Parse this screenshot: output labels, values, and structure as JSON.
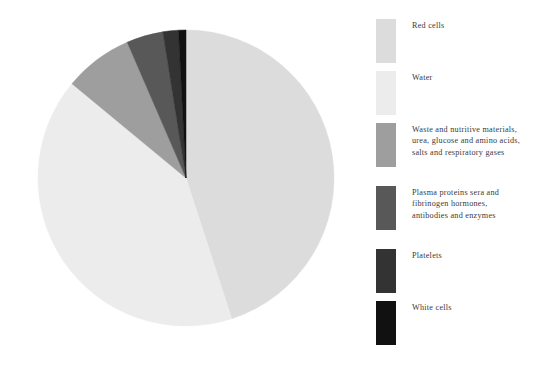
{
  "background_color": "#ffffff",
  "chart_data": {
    "type": "pie",
    "title": "",
    "subtitle": "",
    "xlabel": "",
    "ylabel": "",
    "legend_position": "right",
    "grid": false,
    "start_angle_deg": 0,
    "direction": "clockwise",
    "center": {
      "x": 186,
      "y": 178
    },
    "radius": 148,
    "categories": [
      "Red cells",
      "Water",
      "Waste and nutritive materials,\nurea, glucose and amino acids,\nsalts and respiratory gases",
      "Plasma proteins sera and\nfibrinogen hormones,\nantibodies and enzymes",
      "Platelets",
      "White cells"
    ],
    "values": [
      45.0,
      41.0,
      7.5,
      4.0,
      1.7,
      0.8
    ],
    "colors": [
      "#dcdcdc",
      "#ececec",
      "#9e9e9e",
      "#585858",
      "#333333",
      "#111111"
    ],
    "slices": [
      {
        "label": "Red cells",
        "value": 45.0,
        "color": "#dcdcdc",
        "start_deg": 0.0,
        "end_deg": 162.0
      },
      {
        "label": "Water",
        "value": 41.0,
        "color": "#ececec",
        "start_deg": 162.0,
        "end_deg": 309.6
      },
      {
        "label": "Waste and nutritive materials, urea, glucose and amino acids, salts and respiratory gases",
        "value": 7.5,
        "color": "#9e9e9e",
        "start_deg": 309.6,
        "end_deg": 336.6
      },
      {
        "label": "Plasma proteins sera and fibrinogen hormones, antibodies and enzymes",
        "value": 4.0,
        "color": "#585858",
        "start_deg": 336.6,
        "end_deg": 351.0
      },
      {
        "label": "Platelets",
        "value": 1.7,
        "color": "#333333",
        "start_deg": 351.0,
        "end_deg": 357.1
      },
      {
        "label": "White cells",
        "value": 0.8,
        "color": "#111111",
        "start_deg": 357.1,
        "end_deg": 360.0
      }
    ]
  },
  "legend": {
    "items": [
      {
        "label": "Red cells",
        "color": "#dcdcdc"
      },
      {
        "label": "Water",
        "color": "#ececec"
      },
      {
        "label": "Waste and nutritive materials,\nurea, glucose and amino acids,\nsalts and respiratory gases",
        "color": "#9e9e9e"
      },
      {
        "label": "Plasma proteins sera and\nfibrinogen hormones,\nantibodies and enzymes",
        "color": "#585858"
      },
      {
        "label": "Platelets",
        "color": "#333333"
      },
      {
        "label": "White cells",
        "color": "#111111"
      }
    ]
  }
}
